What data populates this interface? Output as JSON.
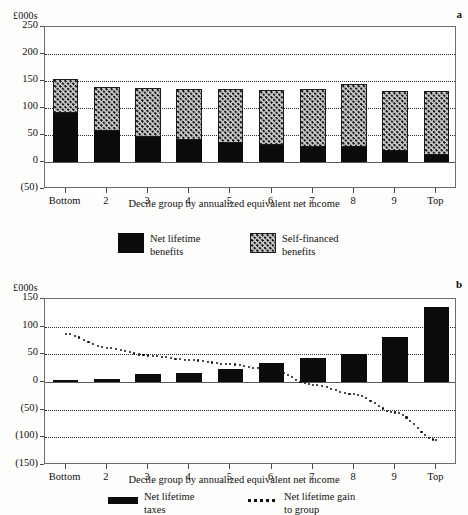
{
  "figure": {
    "panels": [
      "a",
      "b"
    ]
  },
  "panel_a": {
    "letter": "a",
    "units_label": "£000s",
    "xlabel": "Decile group by annualized equivalent net income",
    "categories": [
      "Bottom",
      "2",
      "3",
      "4",
      "5",
      "6",
      "7",
      "8",
      "9",
      "Top"
    ],
    "yticks": [
      "250",
      "200",
      "150",
      "100",
      "50",
      "0",
      "(50)"
    ],
    "legend": [
      {
        "label_line1": "Net lifetime",
        "label_line2": "benefits",
        "swatch": "solid-black-square"
      },
      {
        "label_line1": "Self-financed",
        "label_line2": "benefits",
        "swatch": "hatched-square"
      }
    ]
  },
  "panel_b": {
    "letter": "b",
    "units_label": "£000s",
    "xlabel": "Decile group by annualized equivalent net income",
    "categories": [
      "Bottom",
      "2",
      "3",
      "4",
      "5",
      "6",
      "7",
      "8",
      "9",
      "Top"
    ],
    "yticks": [
      "150",
      "100",
      "50",
      "0",
      "(50)",
      "(100)",
      "(150)"
    ],
    "legend": [
      {
        "label_line1": "Net lifetime",
        "label_line2": "taxes",
        "swatch": "solid-black-bar"
      },
      {
        "label_line1": "Net lifetime gain",
        "label_line2": "to group",
        "swatch": "dotted-line"
      }
    ]
  },
  "chart_data": [
    {
      "type": "bar",
      "id": "panel-a",
      "title": "",
      "panel_label": "a",
      "stacked": true,
      "xlabel": "Decile group by annualized equivalent net income",
      "ylabel": "£000s",
      "categories": [
        "Bottom",
        "2",
        "3",
        "4",
        "5",
        "6",
        "7",
        "8",
        "9",
        "Top"
      ],
      "ylim": [
        -50,
        250
      ],
      "yticks": [
        -50,
        0,
        50,
        100,
        150,
        200,
        250
      ],
      "ytick_labels": [
        "(50)",
        "0",
        "50",
        "100",
        "150",
        "200",
        "250"
      ],
      "grid": true,
      "legend_position": "below",
      "series": [
        {
          "name": "Net lifetime benefits",
          "style": "solid-black",
          "values": [
            90,
            57,
            47,
            41,
            36,
            32,
            28,
            28,
            21,
            13
          ]
        },
        {
          "name": "Self-financed benefits",
          "style": "hatched",
          "values": [
            63,
            81,
            90,
            94,
            100,
            101,
            107,
            116,
            110,
            119
          ]
        }
      ],
      "totals": [
        153,
        138,
        137,
        135,
        136,
        133,
        135,
        144,
        131,
        132
      ]
    },
    {
      "type": "bar",
      "id": "panel-b",
      "title": "",
      "panel_label": "b",
      "stacked": false,
      "xlabel": "Decile group by annualized equivalent net income",
      "ylabel": "£000s",
      "categories": [
        "Bottom",
        "2",
        "3",
        "4",
        "5",
        "6",
        "7",
        "8",
        "9",
        "Top"
      ],
      "ylim": [
        -150,
        150
      ],
      "yticks": [
        -150,
        -100,
        -50,
        0,
        50,
        100,
        150
      ],
      "ytick_labels": [
        "(150)",
        "(100)",
        "(50)",
        "0",
        "50",
        "100",
        "150"
      ],
      "grid": true,
      "legend_position": "below",
      "series": [
        {
          "name": "Net lifetime taxes",
          "style": "solid-black",
          "values": [
            3,
            5,
            14,
            17,
            23,
            34,
            44,
            50,
            81,
            135
          ]
        },
        {
          "name": "Net lifetime gain to group",
          "style": "dotted-line",
          "chart_type": "line",
          "values": [
            87,
            62,
            48,
            40,
            32,
            22,
            -5,
            -22,
            -55,
            -105
          ]
        }
      ]
    }
  ]
}
